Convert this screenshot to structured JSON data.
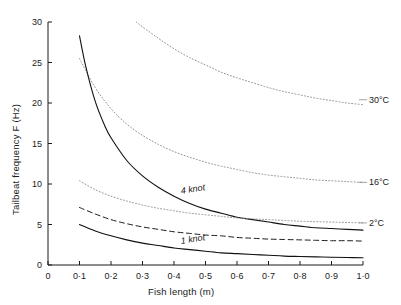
{
  "chart_data": {
    "type": "line",
    "title": "",
    "xlabel": "Fish length (m)",
    "ylabel": "Tailbeat frequency  F  (Hz)",
    "xlim": [
      0,
      1.0
    ],
    "ylim": [
      0,
      30
    ],
    "grid": false,
    "legend_position": "inline-right-of-curves",
    "xticks": [
      "0",
      "0·1",
      "0·2",
      "0·3",
      "0·4",
      "0·5",
      "0·6",
      "0·7",
      "0·8",
      "0·9",
      "1·0"
    ],
    "xtick_values": [
      0,
      0.1,
      0.2,
      0.3,
      0.4,
      0.5,
      0.6,
      0.7,
      0.8,
      0.9,
      1.0
    ],
    "yticks": [
      "0",
      "5",
      "10",
      "15",
      "20",
      "25",
      "30"
    ],
    "ytick_values": [
      0,
      5,
      10,
      15,
      20,
      25,
      30
    ],
    "series": [
      {
        "name": "30°C",
        "label": "30°C",
        "style": "dotted",
        "color": "#8c8c8c",
        "x": [
          0.28,
          0.3,
          0.35,
          0.4,
          0.45,
          0.5,
          0.55,
          0.6,
          0.65,
          0.7,
          0.75,
          0.8,
          0.85,
          0.9,
          0.95,
          1.0
        ],
        "values": [
          30.0,
          29.4,
          28.0,
          26.7,
          25.6,
          24.7,
          23.8,
          23.1,
          22.5,
          21.9,
          21.4,
          21.0,
          20.6,
          20.3,
          20.0,
          19.8
        ]
      },
      {
        "name": "16°C",
        "label": "16°C",
        "style": "dotted",
        "color": "#8c8c8c",
        "x": [
          0.1,
          0.15,
          0.2,
          0.25,
          0.3,
          0.35,
          0.4,
          0.45,
          0.5,
          0.55,
          0.6,
          0.65,
          0.7,
          0.75,
          0.8,
          0.85,
          0.9,
          0.95,
          1.0
        ],
        "values": [
          25.5,
          21.9,
          19.3,
          17.4,
          16.0,
          14.9,
          14.0,
          13.3,
          12.7,
          12.2,
          11.8,
          11.4,
          11.1,
          10.9,
          10.7,
          10.5,
          10.4,
          10.3,
          10.2
        ]
      },
      {
        "name": "4 knot",
        "label": "4 knot",
        "style": "solid",
        "color": "#111111",
        "x": [
          0.1,
          0.12,
          0.15,
          0.18,
          0.2,
          0.25,
          0.3,
          0.35,
          0.4,
          0.45,
          0.5,
          0.55,
          0.6,
          0.65,
          0.7,
          0.75,
          0.8,
          0.85,
          0.9,
          0.95,
          1.0
        ],
        "values": [
          28.3,
          24.5,
          20.2,
          17.2,
          15.7,
          12.9,
          11.0,
          9.6,
          8.5,
          7.6,
          6.9,
          6.4,
          5.9,
          5.6,
          5.3,
          5.0,
          4.8,
          4.6,
          4.5,
          4.4,
          4.3
        ]
      },
      {
        "name": "2°C",
        "label": "2°C",
        "style": "dotted",
        "color": "#8c8c8c",
        "x": [
          0.1,
          0.15,
          0.2,
          0.25,
          0.3,
          0.35,
          0.4,
          0.45,
          0.5,
          0.55,
          0.6,
          0.65,
          0.7,
          0.75,
          0.8,
          0.85,
          0.9,
          0.95,
          1.0
        ],
        "values": [
          10.4,
          9.3,
          8.5,
          7.9,
          7.4,
          7.0,
          6.7,
          6.4,
          6.2,
          6.0,
          5.8,
          5.7,
          5.6,
          5.5,
          5.4,
          5.35,
          5.3,
          5.25,
          5.2
        ]
      },
      {
        "name": "2 knot dashed",
        "label": "",
        "style": "dashed",
        "color": "#111111",
        "x": [
          0.1,
          0.15,
          0.2,
          0.25,
          0.3,
          0.35,
          0.4,
          0.45,
          0.5,
          0.55,
          0.6,
          0.65,
          0.7,
          0.75,
          0.8,
          0.85,
          0.9,
          0.95,
          1.0
        ],
        "values": [
          7.1,
          6.3,
          5.6,
          5.1,
          4.7,
          4.4,
          4.1,
          3.9,
          3.7,
          3.6,
          3.4,
          3.3,
          3.2,
          3.15,
          3.1,
          3.05,
          3.0,
          3.0,
          2.95
        ]
      },
      {
        "name": "1 knot",
        "label": "1 knot",
        "style": "solid",
        "color": "#111111",
        "x": [
          0.1,
          0.15,
          0.2,
          0.25,
          0.3,
          0.35,
          0.4,
          0.45,
          0.5,
          0.55,
          0.6,
          0.65,
          0.7,
          0.75,
          0.8,
          0.85,
          0.9,
          0.95,
          1.0
        ],
        "values": [
          5.0,
          4.2,
          3.6,
          3.1,
          2.7,
          2.4,
          2.1,
          1.9,
          1.7,
          1.5,
          1.4,
          1.3,
          1.2,
          1.1,
          1.05,
          1.0,
          0.95,
          0.92,
          0.9
        ]
      }
    ],
    "annotations": [
      {
        "text": "30°C",
        "x": 1.02,
        "y": 20.4,
        "kind": "series-end-label"
      },
      {
        "text": "16°C",
        "x": 1.02,
        "y": 10.2,
        "kind": "series-end-label"
      },
      {
        "text": "2°C",
        "x": 1.02,
        "y": 5.2,
        "kind": "series-end-label"
      },
      {
        "text": "4 knot",
        "x": 0.42,
        "y": 8.6,
        "kind": "inline-curve-label"
      },
      {
        "text": "1 knot",
        "x": 0.42,
        "y": 2.5,
        "kind": "inline-curve-label"
      }
    ]
  },
  "axes": {
    "x_axis_title": "Fish length (m)",
    "y_axis_title": "Tailbeat frequency  F  (Hz)"
  }
}
